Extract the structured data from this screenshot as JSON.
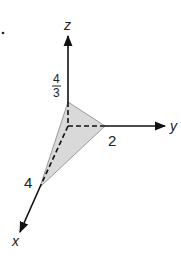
{
  "diagram": {
    "axes": {
      "x": {
        "label": "x",
        "intercept_label": "4"
      },
      "y": {
        "label": "y",
        "intercept_label": "2"
      },
      "z": {
        "label": "z",
        "intercept_num": "4",
        "intercept_den": "3"
      }
    },
    "plane": {
      "fill": "#d9d9d9",
      "edge": "#9a9a9a"
    },
    "axis_color": "#111111"
  }
}
